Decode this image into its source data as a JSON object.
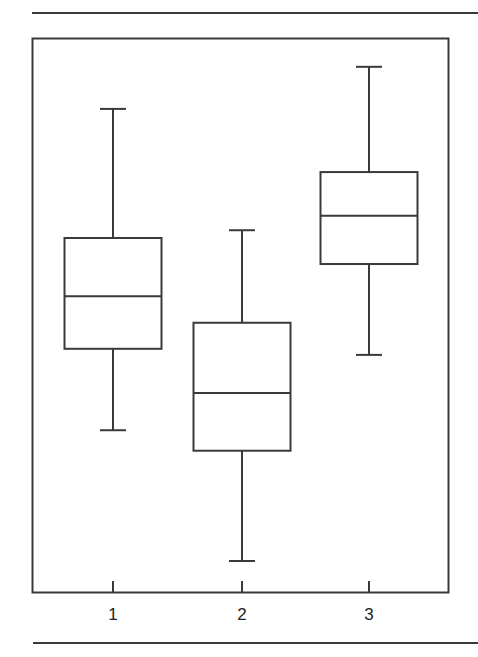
{
  "chart_data": {
    "type": "box",
    "title": "",
    "xlabel": "",
    "ylabel": "",
    "categories": [
      "1",
      "2",
      "3"
    ],
    "y_axis": {
      "visible": false,
      "range": [
        0,
        100
      ],
      "note": "no y-axis ticks shown; values on relative 0-100 scale of plot height"
    },
    "grid": false,
    "legend": null,
    "boxes": [
      {
        "label": "1",
        "whisker_low": 29.2,
        "q1": 43.9,
        "median": 53.4,
        "q3": 63.9,
        "whisker_high": 87.2
      },
      {
        "label": "2",
        "whisker_low": 5.6,
        "q1": 25.5,
        "median": 35.9,
        "q3": 48.6,
        "whisker_high": 65.3
      },
      {
        "label": "3",
        "whisker_low": 42.8,
        "q1": 59.2,
        "median": 67.9,
        "q3": 75.8,
        "whisker_high": 94.8
      }
    ]
  },
  "colors": {
    "line": "#3a3a3a",
    "background": "#ffffff"
  }
}
